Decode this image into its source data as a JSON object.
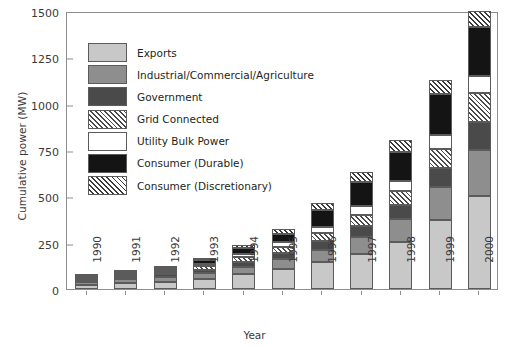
{
  "chart_data": {
    "type": "bar",
    "subtype": "stacked-bar",
    "title": "",
    "xlabel": "Year",
    "ylabel": "Cumulative power (MW)",
    "ylim": [
      0,
      1500
    ],
    "yticks": [
      0,
      250,
      500,
      750,
      1000,
      1250,
      1500
    ],
    "grid": false,
    "legend_position": "upper-left-inside",
    "categories": [
      "1990",
      "1991",
      "1992",
      "1993",
      "1994",
      "1995",
      "1996",
      "1997",
      "1998",
      "1999",
      "2000"
    ],
    "series": [
      {
        "name": "Exports",
        "color": "#c8c8c8",
        "pattern": "solid",
        "values": [
          22,
          30,
          40,
          55,
          80,
          110,
          145,
          190,
          255,
          375,
          500
        ]
      },
      {
        "name": "Industrial/Commercial/Agriculture",
        "color": "#8e8e8e",
        "pattern": "solid",
        "values": [
          18,
          22,
          26,
          32,
          40,
          52,
          65,
          90,
          125,
          175,
          250
        ]
      },
      {
        "name": "Government",
        "color": "#4a4a4a",
        "pattern": "solid",
        "values": [
          10,
          12,
          14,
          18,
          26,
          35,
          48,
          62,
          75,
          105,
          150
        ]
      },
      {
        "name": "Grid Connected",
        "color": "#ffffff",
        "pattern": "diagonal-hatch",
        "values": [
          8,
          10,
          13,
          18,
          25,
          32,
          42,
          58,
          72,
          100,
          155
        ]
      },
      {
        "name": "Utility Bulk Power",
        "color": "#ffffff",
        "pattern": "solid",
        "values": [
          6,
          8,
          10,
          14,
          20,
          26,
          36,
          48,
          58,
          75,
          95
        ]
      },
      {
        "name": "Consumer (Durable)",
        "color": "#141414",
        "pattern": "solid",
        "values": [
          8,
          10,
          13,
          18,
          28,
          42,
          90,
          130,
          155,
          220,
          265
        ]
      },
      {
        "name": "Consumer (Discretionary)",
        "color": "#ffffff",
        "pattern": "cross-hatch",
        "values": [
          6,
          8,
          10,
          14,
          20,
          28,
          38,
          52,
          65,
          80,
          85
        ]
      }
    ],
    "totals": [
      78,
      100,
      126,
      169,
      239,
      325,
      464,
      630,
      805,
      1130,
      1500
    ]
  },
  "axes": {
    "y_tick_labels": [
      "0",
      "250",
      "500",
      "750",
      "1000",
      "1250",
      "1500"
    ],
    "x_tick_labels": [
      "1990",
      "1991",
      "1992",
      "1993",
      "1994",
      "1995",
      "1996",
      "1997",
      "1998",
      "1999",
      "2000"
    ],
    "x_axis_title": "Year",
    "y_axis_title": "Cumulative power (MW)"
  },
  "legend": {
    "items": [
      {
        "label": "Exports",
        "swatch": "exports"
      },
      {
        "label": "Industrial/Commercial/Agriculture",
        "swatch": "industrial"
      },
      {
        "label": "Government",
        "swatch": "government"
      },
      {
        "label": "Grid Connected",
        "swatch": "grid"
      },
      {
        "label": "Utility Bulk Power",
        "swatch": "utility"
      },
      {
        "label": "Consumer (Durable)",
        "swatch": "durable"
      },
      {
        "label": "Consumer (Discretionary)",
        "swatch": "discretionary"
      }
    ]
  }
}
